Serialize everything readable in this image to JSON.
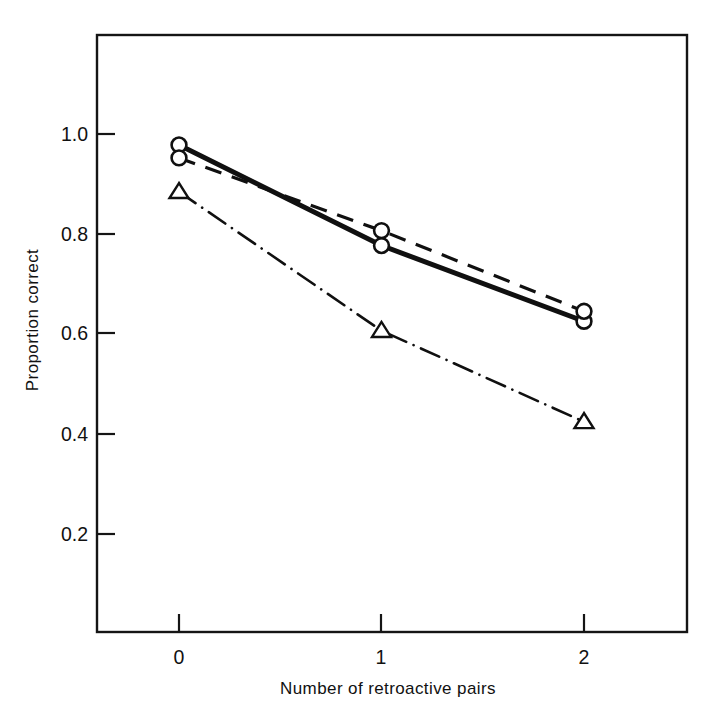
{
  "chart_data": {
    "type": "line",
    "title": "",
    "xlabel": "Number of retroactive pairs",
    "ylabel": "Proportion correct",
    "x": [
      0,
      1,
      2
    ],
    "xticklabels": [
      "0",
      "1",
      "2"
    ],
    "yticks": [
      0.2,
      0.4,
      0.6,
      0.8,
      1.0
    ],
    "yticklabels": [
      "0.2",
      "0.4",
      "0.6",
      "0.8",
      "1.0"
    ],
    "xlim": [
      -0.4,
      2.5
    ],
    "ylim": [
      0.06,
      1.2
    ],
    "grid": false,
    "legend": "none",
    "series": [
      {
        "name": "solid-circle-series",
        "marker": "open-circle",
        "linestyle": "solid",
        "color": "#101010",
        "values": [
          0.978,
          0.776,
          0.624
        ]
      },
      {
        "name": "dashed-circle-series",
        "marker": "open-circle",
        "linestyle": "dashed",
        "color": "#101010",
        "values": [
          0.952,
          0.806,
          0.644
        ]
      },
      {
        "name": "dashdot-triangle-series",
        "marker": "open-triangle",
        "linestyle": "dash-dot",
        "color": "#101010",
        "values": [
          0.884,
          0.605,
          0.422
        ]
      }
    ]
  },
  "axes": {
    "y_tick_0": "0.2",
    "y_tick_1": "0.4",
    "y_tick_2": "0.6",
    "y_tick_3": "0.8",
    "y_tick_4": "1.0",
    "x_tick_0": "0",
    "x_tick_1": "1",
    "x_tick_2": "2",
    "y_title": "Proportion correct",
    "x_title": "Number of retroactive pairs"
  }
}
